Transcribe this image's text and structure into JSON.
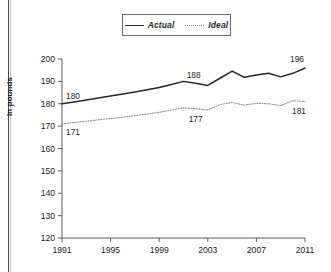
{
  "figure": {
    "y_axis_title": "In pounds"
  },
  "legend": {
    "position": "top-center",
    "items": [
      {
        "label": "Actual",
        "style": "solid",
        "color": "#262626"
      },
      {
        "label": "Ideal",
        "style": "dotted",
        "color": "#8e8e8e"
      }
    ]
  },
  "annotations": [
    {
      "id": "actual-start",
      "text": "180"
    },
    {
      "id": "ideal-start",
      "text": "171"
    },
    {
      "id": "actual-mid",
      "text": "188"
    },
    {
      "id": "ideal-mid",
      "text": "177"
    },
    {
      "id": "actual-end",
      "text": "196"
    },
    {
      "id": "ideal-end",
      "text": "181"
    }
  ],
  "chart_data": {
    "type": "line",
    "title": "",
    "subtitle": "",
    "xlabel": "",
    "ylabel": "In pounds",
    "xlim": [
      1991,
      2011
    ],
    "ylim": [
      120,
      200
    ],
    "grid": false,
    "legend_position": "top-center",
    "x_ticks": [
      "1991",
      "1995",
      "1999",
      "2003",
      "2007",
      "2011"
    ],
    "y_ticks": [
      "120",
      "130",
      "140",
      "150",
      "160",
      "170",
      "180",
      "190",
      "200"
    ],
    "x": [
      1991,
      1992,
      1993,
      1994,
      1995,
      1996,
      1997,
      1998,
      1999,
      2000,
      2001,
      2002,
      2003,
      2004,
      2005,
      2006,
      2007,
      2008,
      2009,
      2010,
      2011
    ],
    "series": [
      {
        "name": "Actual",
        "style": "solid",
        "color": "#262626",
        "values": [
          180,
          180.8,
          181.7,
          182.6,
          183.5,
          184.4,
          185.3,
          186.3,
          187.3,
          188.6,
          190.0,
          189.2,
          188.2,
          191.4,
          194.6,
          191.8,
          192.8,
          193.6,
          192.0,
          193.6,
          196
        ],
        "labeled_points": [
          {
            "x": 1991,
            "y": 180,
            "label": "180"
          },
          {
            "x": 2002,
            "y": 189.2,
            "label": "188"
          },
          {
            "x": 2011,
            "y": 196,
            "label": "196"
          }
        ]
      },
      {
        "name": "Ideal",
        "style": "dotted",
        "color": "#8e8e8e",
        "values": [
          171,
          171.6,
          172.2,
          172.8,
          173.4,
          174.0,
          174.7,
          175.4,
          176.2,
          177.2,
          178.2,
          177.8,
          177.2,
          179.6,
          180.6,
          179.4,
          180.2,
          180.0,
          179.2,
          181.4,
          181
        ],
        "labeled_points": [
          {
            "x": 1991,
            "y": 171,
            "label": "171"
          },
          {
            "x": 2002,
            "y": 177.8,
            "label": "177"
          },
          {
            "x": 2011,
            "y": 181,
            "label": "181"
          }
        ]
      }
    ]
  }
}
